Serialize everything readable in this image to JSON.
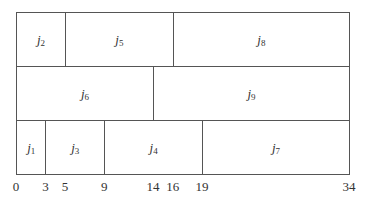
{
  "diagram": {
    "type": "gantt-schedule",
    "axis": {
      "min": 0,
      "max": 34,
      "ticks": [
        0,
        3,
        5,
        9,
        14,
        16,
        19,
        34
      ]
    },
    "rows": [
      [
        {
          "job": "j",
          "sub": "2",
          "start": 0,
          "end": 5
        },
        {
          "job": "j",
          "sub": "5",
          "start": 5,
          "end": 16
        },
        {
          "job": "j",
          "sub": "8",
          "start": 16,
          "end": 34
        }
      ],
      [
        {
          "job": "j",
          "sub": "6",
          "start": 0,
          "end": 14
        },
        {
          "job": "j",
          "sub": "9",
          "start": 14,
          "end": 34
        }
      ],
      [
        {
          "job": "j",
          "sub": "1",
          "start": 0,
          "end": 3
        },
        {
          "job": "j",
          "sub": "3",
          "start": 3,
          "end": 9
        },
        {
          "job": "j",
          "sub": "4",
          "start": 9,
          "end": 19
        },
        {
          "job": "j",
          "sub": "7",
          "start": 19,
          "end": 34
        }
      ]
    ]
  }
}
